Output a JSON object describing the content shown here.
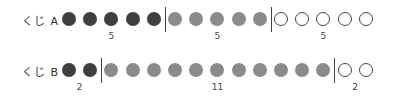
{
  "rows": [
    {
      "label": "くじ A",
      "groups": [
        {
          "count": 5,
          "label": "5",
          "style": "dark"
        },
        {
          "count": 5,
          "label": "5",
          "style": "mid"
        },
        {
          "count": 5,
          "label": "5",
          "style": "empty"
        }
      ]
    },
    {
      "label": "くじ B",
      "groups": [
        {
          "count": 2,
          "label": "2",
          "style": "dark"
        },
        {
          "count": 11,
          "label": "11",
          "style": "mid"
        },
        {
          "count": 2,
          "label": "2",
          "style": "empty"
        }
      ]
    }
  ],
  "colors": {
    "dark": "#3f3f3f",
    "mid": "#8b8b8b",
    "empty_border": "#444444"
  }
}
